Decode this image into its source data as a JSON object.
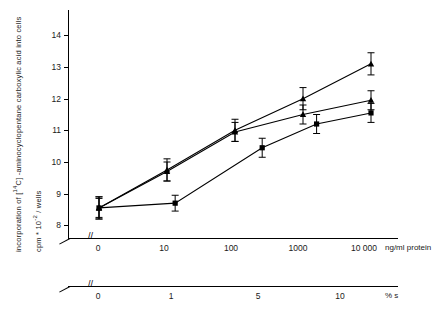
{
  "chart_data": {
    "type": "line",
    "title": "",
    "ylabel_line1": "incorporation of [14C] - aminocyclopentane carboxylic acid into cells",
    "ylabel_line2": "cpm * 10^-2 / wells",
    "ylabel_parts": {
      "prefix": "incorporation of [",
      "iso_sup": "14",
      "iso": "C",
      "suffix": "] -aminocyclopentane carboxylic acid into cells",
      "units_pre": "cpm * 10",
      "units_exp": "-2",
      "units_post": " / wells"
    },
    "ylim": [
      7.6,
      14.8
    ],
    "yticks": [
      8,
      9,
      10,
      11,
      12,
      13,
      14
    ],
    "ytick_labels": [
      "8",
      "9",
      "10",
      "11",
      "12",
      "13",
      "14"
    ],
    "grid": false,
    "legend": "none",
    "x_axis_primary": {
      "label": "ng/ml protein",
      "tick_labels": [
        "0",
        "10",
        "100",
        "1000",
        "10 000"
      ],
      "axis_break": true
    },
    "x_axis_secondary": {
      "label": "% s",
      "tick_labels": [
        "0",
        "1",
        "5",
        "10"
      ],
      "axis_break": true
    },
    "series": [
      {
        "name": "series-1",
        "marker": "triangle-up",
        "x_labels": [
          "0",
          "10",
          "100",
          "1000",
          "10 000"
        ],
        "x_pos": [
          0.0,
          0.25,
          0.5,
          0.75,
          1.0
        ],
        "values": [
          8.55,
          9.75,
          11.0,
          12.0,
          13.1
        ],
        "errors": [
          0.35,
          0.35,
          0.35,
          0.35,
          0.35
        ]
      },
      {
        "name": "series-2",
        "marker": "triangle-up",
        "x_labels": [
          "0",
          "10",
          "100",
          "1000",
          "10 000"
        ],
        "x_pos": [
          0.0,
          0.25,
          0.5,
          0.75,
          1.0
        ],
        "values": [
          8.55,
          9.7,
          10.95,
          11.5,
          11.95
        ],
        "errors": [
          0.35,
          0.3,
          0.3,
          0.3,
          0.3
        ]
      },
      {
        "name": "series-3",
        "marker": "square",
        "x_labels": [
          "0",
          "10",
          "100",
          "1000",
          "10 000"
        ],
        "x_pos": [
          0.0,
          0.28,
          0.6,
          0.8,
          1.0
        ],
        "values": [
          8.55,
          8.7,
          10.45,
          11.2,
          11.55
        ],
        "errors": [
          0.3,
          0.25,
          0.3,
          0.3,
          0.3
        ]
      }
    ]
  }
}
